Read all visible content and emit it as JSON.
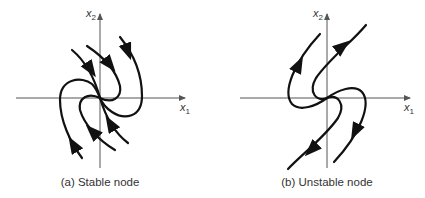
{
  "figure": {
    "panels": [
      {
        "id": "a",
        "caption": "(a) Stable node",
        "x_axis_label": "x",
        "x_axis_sub": "1",
        "y_axis_label": "x",
        "y_axis_sub": "2",
        "flow_direction": "toward origin"
      },
      {
        "id": "b",
        "caption": "(b) Unstable node",
        "x_axis_label": "x",
        "x_axis_sub": "1",
        "y_axis_label": "x",
        "y_axis_sub": "2",
        "flow_direction": "away from origin"
      }
    ],
    "colors": {
      "curve": "#111111",
      "axis": "#555555",
      "text": "#333333"
    }
  }
}
